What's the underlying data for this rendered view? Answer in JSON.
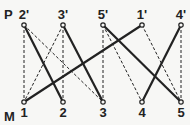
{
  "rows": {
    "top": {
      "label": "P",
      "nodes": [
        "2'",
        "3'",
        "5'",
        "1'",
        "4'"
      ]
    },
    "bottom": {
      "label": "M",
      "nodes": [
        "1",
        "2",
        "3",
        "4",
        "5"
      ]
    }
  },
  "edges": [
    {
      "from": "2'",
      "to": "2",
      "style": "solid"
    },
    {
      "from": "3'",
      "to": "3",
      "style": "solid"
    },
    {
      "from": "5'",
      "to": "5",
      "style": "solid"
    },
    {
      "from": "1'",
      "to": "1",
      "style": "solid"
    },
    {
      "from": "4'",
      "to": "4",
      "style": "solid"
    },
    {
      "from": "2'",
      "to": "1",
      "style": "dashed"
    },
    {
      "from": "2'",
      "to": "3",
      "style": "dashed"
    },
    {
      "from": "3'",
      "to": "1",
      "style": "dashed"
    },
    {
      "from": "3'",
      "to": "2",
      "style": "dashed"
    },
    {
      "from": "5'",
      "to": "3",
      "style": "dashed"
    },
    {
      "from": "5'",
      "to": "4",
      "style": "dashed"
    },
    {
      "from": "1'",
      "to": "5",
      "style": "dashed"
    },
    {
      "from": "4'",
      "to": "5",
      "style": "dashed"
    }
  ],
  "colors": {
    "line": "#222222",
    "background": "#f7f7f5"
  }
}
